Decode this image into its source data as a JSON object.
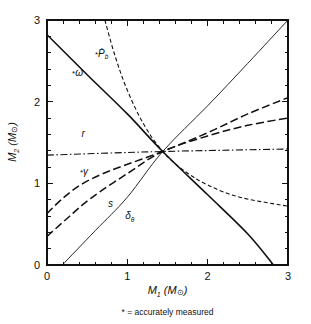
{
  "figure": {
    "footnote": "* = accurately measured"
  },
  "chart_data": {
    "type": "line",
    "title": "",
    "xlabel": "M1 (MSun)",
    "ylabel": "M2 (MSun)",
    "xlabel_main": "M",
    "xlabel_sub": "1",
    "xlabel_unit_open": " (M",
    "xlabel_unit_sym": "⊙",
    "xlabel_unit_close": ")",
    "ylabel_main": "M",
    "ylabel_sub": "2",
    "ylabel_unit_open": " (M",
    "ylabel_unit_sym": "⊙",
    "ylabel_unit_close": ")",
    "xlim": [
      0,
      3
    ],
    "ylim": [
      0,
      3
    ],
    "xticks": [
      0,
      1,
      2,
      3
    ],
    "yticks": [
      0,
      1,
      2,
      3
    ],
    "xticklabels": [
      "0",
      "1",
      "2",
      "3"
    ],
    "yticklabels": [
      "0",
      "1",
      "2",
      "3"
    ],
    "minor_tick_step": 0.2,
    "grid": false,
    "legend": "inline-curve-labels",
    "intersection": [
      1.44,
      1.39
    ],
    "series": [
      {
        "name": "omega-dot",
        "label": "*ω̇",
        "label_star": "*",
        "label_sym": "ω",
        "style": "solid",
        "label_x": 0.38,
        "label_y": 2.32,
        "points": [
          [
            0.0,
            2.82
          ],
          [
            0.5,
            2.33
          ],
          [
            1.0,
            1.85
          ],
          [
            1.44,
            1.39
          ],
          [
            2.0,
            0.86
          ],
          [
            2.5,
            0.38
          ],
          [
            2.82,
            0.0
          ]
        ]
      },
      {
        "name": "P-dot-b",
        "label": "*Ṗb",
        "label_star": "*",
        "label_sym": "Ṗ",
        "label_sub": "b",
        "style": "dashed",
        "label_x": 0.68,
        "label_y": 2.55,
        "points": [
          [
            0.72,
            3.0
          ],
          [
            0.85,
            2.55
          ],
          [
            1.0,
            2.14
          ],
          [
            1.2,
            1.73
          ],
          [
            1.44,
            1.39
          ],
          [
            1.7,
            1.16
          ],
          [
            2.0,
            0.98
          ],
          [
            2.4,
            0.83
          ],
          [
            3.0,
            0.72
          ]
        ]
      },
      {
        "name": "r",
        "label": "r",
        "style": "dashdot",
        "label_x": 0.45,
        "label_y": 1.57,
        "points": [
          [
            0.0,
            1.345
          ],
          [
            0.75,
            1.37
          ],
          [
            1.44,
            1.39
          ],
          [
            2.2,
            1.405
          ],
          [
            3.0,
            1.42
          ]
        ]
      },
      {
        "name": "gamma",
        "label": "*γ",
        "label_star": "*",
        "label_sym": "γ",
        "style": "dashed-long",
        "label_x": 0.46,
        "label_y": 1.1,
        "points": [
          [
            0.0,
            0.63
          ],
          [
            0.2,
            0.82
          ],
          [
            0.45,
            1.0
          ],
          [
            0.8,
            1.16
          ],
          [
            1.44,
            1.39
          ],
          [
            2.0,
            1.62
          ],
          [
            2.5,
            1.85
          ],
          [
            3.0,
            2.05
          ]
        ]
      },
      {
        "name": "s",
        "label": "s",
        "style": "dashed-long",
        "label_x": 0.79,
        "label_y": 0.71,
        "points": [
          [
            0.0,
            0.35
          ],
          [
            0.25,
            0.57
          ],
          [
            0.55,
            0.82
          ],
          [
            1.0,
            1.12
          ],
          [
            1.44,
            1.39
          ],
          [
            2.0,
            1.58
          ],
          [
            2.5,
            1.71
          ],
          [
            3.0,
            1.8
          ]
        ]
      },
      {
        "name": "delta-theta",
        "label": "δθ",
        "label_sym": "δ",
        "label_sub": "θ",
        "style": "thin-solid",
        "label_x": 1.03,
        "label_y": 0.56,
        "points": [
          [
            0.19,
            0.0
          ],
          [
            0.6,
            0.42
          ],
          [
            1.0,
            0.83
          ],
          [
            1.44,
            1.39
          ],
          [
            2.0,
            1.95
          ],
          [
            2.5,
            2.47
          ],
          [
            3.0,
            3.0
          ]
        ]
      }
    ]
  }
}
